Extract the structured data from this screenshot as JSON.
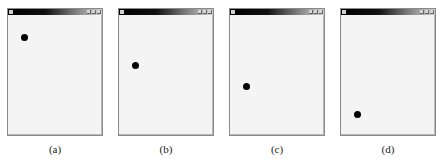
{
  "figure": {
    "panels": [
      {
        "label": "(a)",
        "window_left": 7,
        "dot": {
          "x": 12,
          "y": 19
        }
      },
      {
        "label": "(b)",
        "window_left": 118,
        "dot": {
          "x": 12,
          "y": 47
        }
      },
      {
        "label": "(c)",
        "window_left": 229,
        "dot": {
          "x": 12,
          "y": 68
        }
      },
      {
        "label": "(d)",
        "window_left": 340,
        "dot": {
          "x": 12,
          "y": 96
        }
      }
    ],
    "colors": {
      "titlebar_start": "#000000",
      "titlebar_end": "#d0d0d0",
      "client_bg": "#f4f4f4",
      "ball": "#000000"
    }
  }
}
